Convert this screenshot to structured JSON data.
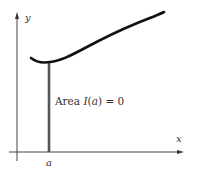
{
  "diagram": {
    "title": "",
    "labels": {
      "y_axis": "y",
      "x_axis": "x",
      "a_tick": "a",
      "area_prefix": "Area ",
      "area_func": "I",
      "area_arg_open": "(",
      "area_arg": "a",
      "area_arg_close": ")",
      "area_equals": " = 0"
    },
    "colors": {
      "curve": "#111111",
      "axes": "#444444",
      "vertical_segment": "#555555",
      "text": "#333333"
    },
    "elements": [
      {
        "type": "axis",
        "name": "x-axis",
        "direction": "horizontal",
        "arrow": true
      },
      {
        "type": "axis",
        "name": "y-axis",
        "direction": "vertical",
        "arrow": true
      },
      {
        "type": "curve",
        "name": "function-curve",
        "description": "smooth curve dipping to a minimum near x = a then rising to the right"
      },
      {
        "type": "segment",
        "name": "vertical-line-at-a",
        "description": "vertical line from x-axis at a up to the curve"
      },
      {
        "type": "annotation",
        "name": "area-label",
        "text": "Area I(a) = 0"
      }
    ]
  }
}
